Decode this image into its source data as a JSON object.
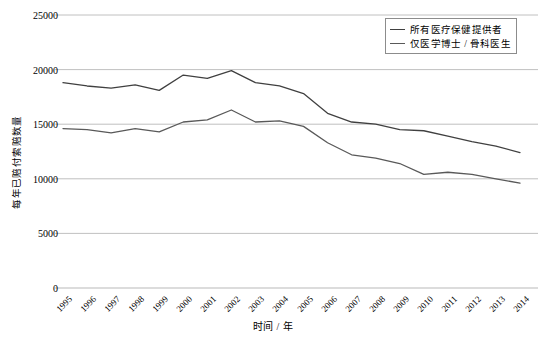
{
  "chart_data": {
    "type": "line",
    "title": "",
    "xlabel": "时间 / 年",
    "ylabel": "每年已赔付索赔数量",
    "categories": [
      "1995",
      "1996",
      "1997",
      "1998",
      "1999",
      "2000",
      "2001",
      "2002",
      "2003",
      "2004",
      "2005",
      "2006",
      "2007",
      "2008",
      "2009",
      "2010",
      "2011",
      "2012",
      "2013",
      "2014"
    ],
    "xlim": [
      "1995",
      "2014"
    ],
    "ylim": [
      0,
      25000
    ],
    "yticks": [
      0,
      5000,
      10000,
      15000,
      20000,
      25000
    ],
    "ytick_labels": [
      "0",
      "5000",
      "10000",
      "15000",
      "20000",
      "25000"
    ],
    "grid": "horizontal",
    "legend_position": "top-right",
    "series": [
      {
        "name": "所有医疗保健提供者",
        "color": "#404040",
        "values": [
          18800,
          18500,
          18300,
          18600,
          18100,
          19500,
          19200,
          19900,
          18800,
          18500,
          17800,
          16000,
          15200,
          15000,
          14500,
          14400,
          13900,
          13400,
          13000,
          12400
        ]
      },
      {
        "name": "仅医学博士 / 骨科医生",
        "color": "#595959",
        "values": [
          14600,
          14500,
          14200,
          14600,
          14300,
          15200,
          15400,
          16300,
          15200,
          15300,
          14800,
          13300,
          12200,
          11900,
          11400,
          10400,
          10600,
          10400,
          10000,
          9600
        ]
      }
    ]
  },
  "axis": {
    "ylabel_text": "每年已赔付索赔数量",
    "xlabel_text": "时间 / 年"
  },
  "legend": {
    "items": [
      {
        "label": "所有医疗保健提供者"
      },
      {
        "label": "仅医学博士 / 骨科医生"
      }
    ]
  }
}
